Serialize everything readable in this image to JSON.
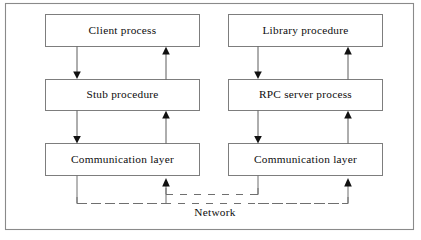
{
  "diagram": {
    "network_label": "Network",
    "colors": {
      "frame_stroke": "#8a8a8a",
      "box_stroke": "#7d7d7d",
      "text": "#0d0d0d",
      "arrow": "#5d5d5d",
      "arrow_head": "#111111",
      "network_dash": "#6f6f6f",
      "background": "#ffffff"
    },
    "columns": [
      {
        "id": "client-side",
        "nodes": [
          {
            "id": "client-process",
            "label": "Client process"
          },
          {
            "id": "stub-procedure",
            "label": "Stub  procedure"
          },
          {
            "id": "communication-layer-left",
            "label": "Communication  layer"
          }
        ]
      },
      {
        "id": "server-side",
        "nodes": [
          {
            "id": "library-procedure",
            "label": "Library  procedure"
          },
          {
            "id": "rpc-server-process",
            "label": "RPC server process"
          },
          {
            "id": "communication-layer-right",
            "label": "Communication  layer"
          }
        ]
      }
    ],
    "connectors": [
      {
        "id": "client-to-stub",
        "direction": "down"
      },
      {
        "id": "stub-to-client",
        "direction": "up"
      },
      {
        "id": "stub-to-comm-left",
        "direction": "down"
      },
      {
        "id": "comm-left-to-stub",
        "direction": "up"
      },
      {
        "id": "library-to-rpc",
        "direction": "down"
      },
      {
        "id": "rpc-to-library",
        "direction": "up"
      },
      {
        "id": "rpc-to-comm-right",
        "direction": "down"
      },
      {
        "id": "comm-right-to-rpc",
        "direction": "up"
      },
      {
        "id": "comm-left-to-network",
        "direction": "down"
      },
      {
        "id": "network-to-comm-left",
        "direction": "up"
      },
      {
        "id": "comm-right-to-network",
        "direction": "down"
      },
      {
        "id": "network-to-comm-right",
        "direction": "up"
      }
    ]
  }
}
